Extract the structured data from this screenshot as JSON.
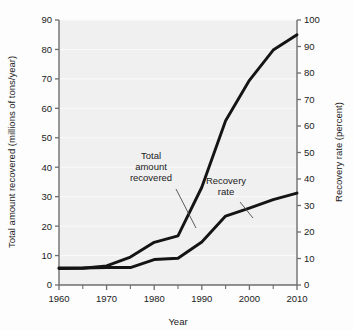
{
  "figure": {
    "background_color": "#fdfdfd",
    "plot_background_color": "#f0f0f0",
    "line_color": "#141414",
    "axis_color": "#6e6e6e",
    "grid_color": "#fafafa"
  },
  "chart_data": {
    "type": "line",
    "title": "",
    "xlabel": "Year",
    "ylabel": "Total amount recovered (millions of tons/year)",
    "ylabel_right": "Recovery rate (percent)",
    "xlim": [
      1960,
      2010
    ],
    "ylim": [
      0,
      90
    ],
    "ylim_right": [
      0,
      100
    ],
    "xticks": [
      1960,
      1970,
      1980,
      1990,
      2000,
      2010
    ],
    "xticks_minor": [
      1965,
      1975,
      1985,
      1995,
      2005
    ],
    "yticks": [
      0,
      10,
      20,
      30,
      40,
      50,
      60,
      70,
      80,
      90
    ],
    "yticks_right": [
      0,
      10,
      20,
      30,
      40,
      50,
      60,
      70,
      80,
      90,
      100
    ],
    "grid": true,
    "grid_axis": "y",
    "legend_position": "inline-annotations",
    "x": [
      1960,
      1965,
      1970,
      1975,
      1980,
      1985,
      1990,
      1995,
      2000,
      2005,
      2010
    ],
    "series": [
      {
        "name": "Total amount recovered",
        "axis": "left",
        "units": "millions of tons/year",
        "values": [
          5.6,
          5.7,
          6.5,
          9.5,
          14.5,
          16.7,
          33.2,
          55.8,
          69.5,
          79.8,
          85.0
        ]
      },
      {
        "name": "Recovery rate",
        "axis": "right",
        "units": "percent",
        "values": [
          6.4,
          6.4,
          6.6,
          6.6,
          9.6,
          10.1,
          16.2,
          26.0,
          29.0,
          32.2,
          34.7
        ]
      }
    ],
    "annotations": [
      {
        "id": "annotation-total-amount-recovered",
        "text_lines": [
          "Total",
          "amount",
          "recovered"
        ],
        "text_x": 151,
        "text_y": 159,
        "leader_from_x": 176,
        "leader_from_y": 189,
        "leader_to_x": 196,
        "leader_to_y": 228
      },
      {
        "id": "annotation-recovery-rate",
        "text_lines": [
          "Recovery",
          "rate"
        ],
        "text_x": 226,
        "text_y": 184,
        "leader_from_x": 240,
        "leader_from_y": 202,
        "leader_to_x": 253,
        "leader_to_y": 218
      }
    ]
  },
  "xtick_labels": [
    "1960",
    "1970",
    "1980",
    "1990",
    "2000",
    "2010"
  ],
  "ytick_left_labels": [
    "0",
    "10",
    "20",
    "30",
    "40",
    "50",
    "60",
    "70",
    "80",
    "90"
  ],
  "ytick_right_labels": [
    "0",
    "10",
    "20",
    "30",
    "40",
    "50",
    "60",
    "70",
    "80",
    "90",
    "100"
  ],
  "labels": {
    "x_axis_title": "Year",
    "y_axis_left_title": "Total amount recovered (millions of tons/year)",
    "y_axis_right_title": "Recovery rate (percent)",
    "annotation_total": "Total amount recovered",
    "annotation_total_line1": "Total",
    "annotation_total_line2": "amount",
    "annotation_total_line3": "recovered",
    "annotation_rate": "Recovery rate",
    "annotation_rate_line1": "Recovery",
    "annotation_rate_line2": "rate"
  }
}
